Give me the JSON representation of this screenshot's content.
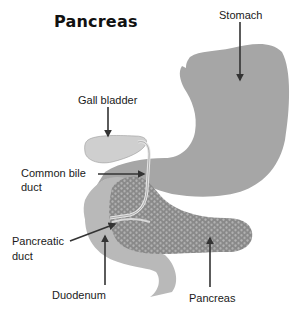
{
  "title": "Pancreas",
  "labels": {
    "stomach": "Stomach",
    "gall_bladder": "Gall bladder",
    "common_bile_duct_line1": "Common bile",
    "common_bile_duct_line2": "duct",
    "pancreatic_duct_line1": "Pancreatic",
    "pancreatic_duct_line2": "duct",
    "duodenum": "Duodenum",
    "pancreas": "Pancreas"
  },
  "colors": {
    "stomach": "#a6a6a6",
    "duodenum": "#b9b9b9",
    "gall_bladder": "#cfcfcf",
    "pancreas": "#8e8e8e",
    "pancreas_cell": "#b0b0b0",
    "arrow": "#333333"
  }
}
